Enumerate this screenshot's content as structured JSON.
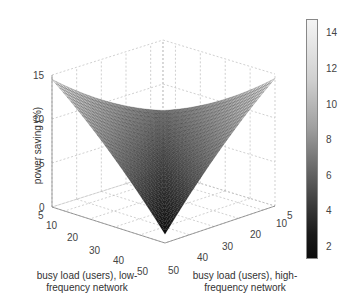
{
  "chart_data": {
    "type": "surface3d",
    "title": "",
    "xlabel": "busy load (users), low-frequency network",
    "ylabel": "busy load (users), high-frequency network",
    "zlabel": "power saving (%)",
    "x_ticks": [
      "5",
      "10",
      "20",
      "30",
      "40",
      "50"
    ],
    "y_ticks": [
      "5",
      "10",
      "20",
      "30",
      "40",
      "50"
    ],
    "z_ticks": [
      "0",
      "5",
      "10",
      "15"
    ],
    "xlim": [
      5,
      50
    ],
    "ylim": [
      5,
      50
    ],
    "zlim": [
      0,
      15
    ],
    "colorbar": {
      "ticks": [
        "2",
        "4",
        "6",
        "8",
        "10",
        "12",
        "14"
      ],
      "range": [
        1.2,
        14.8
      ],
      "colormap": "gray"
    },
    "surface_samples": [
      {
        "x": 5,
        "y": 50,
        "z": 14.5
      },
      {
        "x": 50,
        "y": 5,
        "z": 14.0
      },
      {
        "x": 5,
        "y": 5,
        "z": 7.0
      },
      {
        "x": 27,
        "y": 27,
        "z": 3.0
      },
      {
        "x": 50,
        "y": 50,
        "z": 1.0
      },
      {
        "x": 5,
        "y": 27,
        "z": 10.5
      },
      {
        "x": 27,
        "y": 5,
        "z": 10.0
      },
      {
        "x": 50,
        "y": 27,
        "z": 6.0
      },
      {
        "x": 27,
        "y": 50,
        "z": 6.5
      }
    ]
  },
  "labels": {
    "zlabel": "power saving (%)",
    "xlabel_line1": "busy load (users), low-",
    "xlabel_line2": "frequency network",
    "ylabel_line1": "busy load (users), high-",
    "ylabel_line2": "frequency network"
  }
}
